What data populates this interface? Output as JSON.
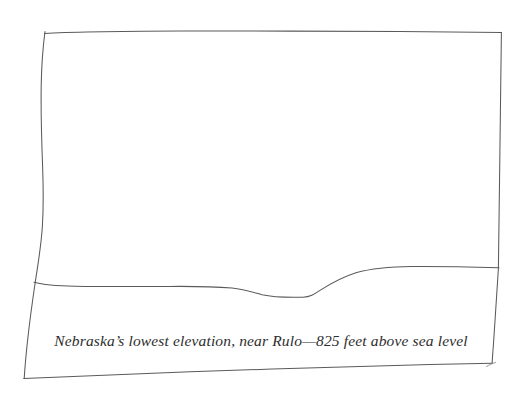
{
  "image": {
    "kind": "hand-drawn-landscape-sketch",
    "width": 522,
    "height": 396,
    "background_color": "#ffffff",
    "ink_color": "#5a5a5a"
  },
  "caption": {
    "text": "Nebraska’s lowest elevation, near Rulo—825 feet above sea level",
    "style": "italic-serif",
    "color": "#2e2e2e"
  },
  "drawing": {
    "frame": {
      "name": "hand-drawn-rectangle-border",
      "stroke_color": "#5a5a5a",
      "stroke_width": 1,
      "corners": {
        "top_left": [
          44,
          32
        ],
        "top_right": [
          501,
          32
        ],
        "bottom_right": [
          492,
          363
        ],
        "bottom_left": [
          24,
          378
        ]
      }
    },
    "horizon": {
      "name": "horizon-line",
      "stroke_color": "#5a5a5a",
      "stroke_width": 1,
      "description": "nearly flat ground line with a shallow valley dip near center-right, rising to a higher plateau on the right",
      "left_end": [
        34,
        283
      ],
      "right_end": [
        499,
        268
      ],
      "low_point_y": 297,
      "high_point_y": 267
    }
  }
}
